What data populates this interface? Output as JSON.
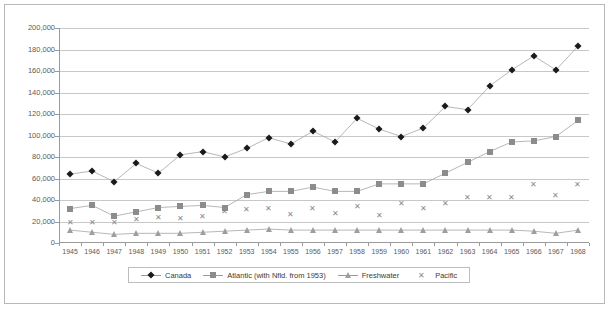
{
  "chart_data": {
    "type": "line",
    "title": "",
    "subtitle": "",
    "xlabel": "",
    "ylabel": "",
    "grid": true,
    "legend_position": "bottom",
    "ylim": [
      0,
      200000
    ],
    "ytick_step": 20000,
    "ytick_labels": [
      "200,000",
      "180,000",
      "160,000",
      "140,000",
      "120,000",
      "100,000",
      "80,000",
      "60,000",
      "40,000",
      "20,000",
      "0"
    ],
    "ytick_values": [
      200000,
      180000,
      160000,
      140000,
      120000,
      100000,
      80000,
      60000,
      40000,
      20000,
      0
    ],
    "categories": [
      "1945",
      "1946",
      "1947",
      "1948",
      "1949",
      "1950",
      "1951",
      "1952",
      "1953",
      "1954",
      "1955",
      "1956",
      "1957",
      "1958",
      "1959",
      "1960",
      "1961",
      "1962",
      "1963",
      "1964",
      "1965",
      "1966",
      "1967",
      "1968"
    ],
    "series": [
      {
        "name": "Canada",
        "marker": "diamond",
        "color": "#1a1a1a",
        "values": [
          64000,
          67000,
          57000,
          74000,
          65000,
          82000,
          85000,
          80000,
          88000,
          98000,
          92000,
          104000,
          94000,
          116000,
          106000,
          99000,
          107000,
          127000,
          124000,
          146000,
          161000,
          174000,
          161000,
          183000
        ]
      },
      {
        "name": "Atlantic (with Nfld. from 1953)",
        "marker": "square",
        "color": "#8c8c8c",
        "values": [
          32000,
          35000,
          25000,
          29000,
          33000,
          34000,
          35000,
          33000,
          45000,
          48000,
          48000,
          52000,
          48000,
          48000,
          55000,
          55000,
          55000,
          65000,
          75000,
          85000,
          94000,
          95000,
          99000,
          114000
        ]
      },
      {
        "name": "Freshwater",
        "marker": "triangle",
        "color": "#9e9e9e",
        "values": [
          12000,
          10000,
          8000,
          9000,
          9000,
          9000,
          10000,
          11000,
          12000,
          13000,
          12000,
          12000,
          12000,
          12000,
          12000,
          12000,
          12000,
          12000,
          12000,
          12000,
          12000,
          11000,
          9000,
          12000
        ]
      },
      {
        "name": "Pacific",
        "marker": "cross",
        "color": "#8a8a8a",
        "values": [
          20000,
          20000,
          20000,
          22000,
          24000,
          23000,
          25000,
          30000,
          32000,
          33000,
          27000,
          33000,
          28000,
          34000,
          26000,
          37000,
          33000,
          37000,
          43000,
          43000,
          43000,
          55000,
          45000,
          55000
        ]
      }
    ]
  }
}
